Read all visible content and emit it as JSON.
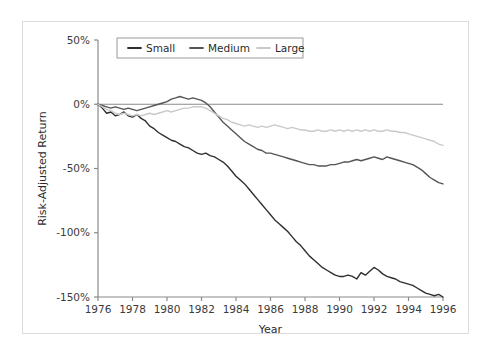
{
  "chart_data": {
    "type": "line",
    "title": "",
    "xlabel": "Year",
    "ylabel": "Risk-Adjusted Return",
    "xlim": [
      1976,
      1996
    ],
    "ylim": [
      -150,
      50
    ],
    "grid": false,
    "legend_position": "top-center",
    "xticks": [
      1976,
      1978,
      1980,
      1982,
      1984,
      1986,
      1988,
      1990,
      1992,
      1994,
      1996
    ],
    "xtick_labels": [
      "1976",
      "1978",
      "1980",
      "1982",
      "1984",
      "1986",
      "1988",
      "1990",
      "1992",
      "1994",
      "1996"
    ],
    "yticks": [
      50,
      0,
      -50,
      -100,
      -150
    ],
    "ytick_labels": [
      "50%",
      "0%",
      "-50%",
      "-100%",
      "-150%"
    ],
    "zero_line": 0,
    "colors": {
      "small": "#2f2f2f",
      "medium": "#555555",
      "large": "#c9c9c9",
      "axis": "#8a8a8a",
      "zero_line": "#8a8a8a",
      "frame": "#dcdcdc",
      "text": "#2b2b2b",
      "background": "#ffffff"
    },
    "x": [
      1976.0,
      1976.25,
      1976.5,
      1976.75,
      1977.0,
      1977.25,
      1977.5,
      1977.75,
      1978.0,
      1978.25,
      1978.5,
      1978.75,
      1979.0,
      1979.25,
      1979.5,
      1979.75,
      1980.0,
      1980.25,
      1980.5,
      1980.75,
      1981.0,
      1981.25,
      1981.5,
      1981.75,
      1982.0,
      1982.25,
      1982.5,
      1982.75,
      1983.0,
      1983.25,
      1983.5,
      1983.75,
      1984.0,
      1984.25,
      1984.5,
      1984.75,
      1985.0,
      1985.25,
      1985.5,
      1985.75,
      1986.0,
      1986.25,
      1986.5,
      1986.75,
      1987.0,
      1987.25,
      1987.5,
      1987.75,
      1988.0,
      1988.25,
      1988.5,
      1988.75,
      1989.0,
      1989.25,
      1989.5,
      1989.75,
      1990.0,
      1990.25,
      1990.5,
      1990.75,
      1991.0,
      1991.25,
      1991.5,
      1991.75,
      1992.0,
      1992.25,
      1992.5,
      1992.75,
      1993.0,
      1993.25,
      1993.5,
      1993.75,
      1994.0,
      1994.25,
      1994.5,
      1994.75,
      1995.0,
      1995.25,
      1995.5,
      1995.75,
      1996.0
    ],
    "series": [
      {
        "name": "Small",
        "color": "#2f2f2f",
        "values": [
          0,
          -3,
          -7,
          -6,
          -9,
          -8,
          -6,
          -9,
          -10,
          -8,
          -11,
          -13,
          -17,
          -19,
          -22,
          -24,
          -26,
          -28,
          -29,
          -31,
          -33,
          -34,
          -36,
          -38,
          -39,
          -38,
          -40,
          -41,
          -43,
          -45,
          -48,
          -52,
          -56,
          -59,
          -62,
          -66,
          -70,
          -74,
          -78,
          -82,
          -86,
          -90,
          -93,
          -96,
          -99,
          -103,
          -107,
          -110,
          -114,
          -118,
          -121,
          -124,
          -127,
          -129,
          -131,
          -133,
          -134,
          -134,
          -133,
          -134,
          -136,
          -131,
          -133,
          -130,
          -127,
          -129,
          -132,
          -134,
          -135,
          -136,
          -138,
          -139,
          -140,
          -141,
          -143,
          -145,
          -147,
          -148,
          -149,
          -148,
          -150
        ]
      },
      {
        "name": "Medium",
        "color": "#555555",
        "values": [
          0,
          -1,
          -2,
          -3,
          -2,
          -3,
          -4,
          -3,
          -4,
          -5,
          -4,
          -3,
          -2,
          -1,
          0,
          1,
          2,
          4,
          5,
          6,
          5,
          4,
          5,
          4,
          3,
          1,
          -2,
          -6,
          -10,
          -14,
          -17,
          -20,
          -23,
          -26,
          -29,
          -31,
          -33,
          -35,
          -36,
          -38,
          -38,
          -39,
          -40,
          -41,
          -42,
          -43,
          -44,
          -45,
          -46,
          -47,
          -47,
          -48,
          -48,
          -48,
          -47,
          -47,
          -46,
          -45,
          -45,
          -44,
          -43,
          -44,
          -43,
          -42,
          -41,
          -42,
          -43,
          -41,
          -42,
          -43,
          -44,
          -45,
          -46,
          -47,
          -49,
          -51,
          -54,
          -57,
          -59,
          -61,
          -62
        ]
      },
      {
        "name": "Large",
        "color": "#c9c9c9",
        "values": [
          0,
          -2,
          -4,
          -5,
          -7,
          -8,
          -7,
          -8,
          -9,
          -8,
          -9,
          -8,
          -7,
          -8,
          -7,
          -6,
          -5,
          -6,
          -5,
          -4,
          -3,
          -3,
          -2,
          -2,
          -2,
          -3,
          -5,
          -7,
          -9,
          -11,
          -12,
          -14,
          -15,
          -16,
          -17,
          -16,
          -17,
          -18,
          -17,
          -18,
          -17,
          -16,
          -17,
          -18,
          -19,
          -18,
          -19,
          -20,
          -20,
          -21,
          -21,
          -20,
          -21,
          -21,
          -20,
          -21,
          -20,
          -21,
          -20,
          -21,
          -20,
          -21,
          -20,
          -21,
          -20,
          -21,
          -21,
          -20,
          -21,
          -21,
          -22,
          -22,
          -23,
          -24,
          -25,
          -26,
          -27,
          -28,
          -29,
          -31,
          -32
        ]
      }
    ]
  },
  "legend": {
    "items": [
      {
        "label": "Small"
      },
      {
        "label": "Medium"
      },
      {
        "label": "Large"
      }
    ]
  }
}
